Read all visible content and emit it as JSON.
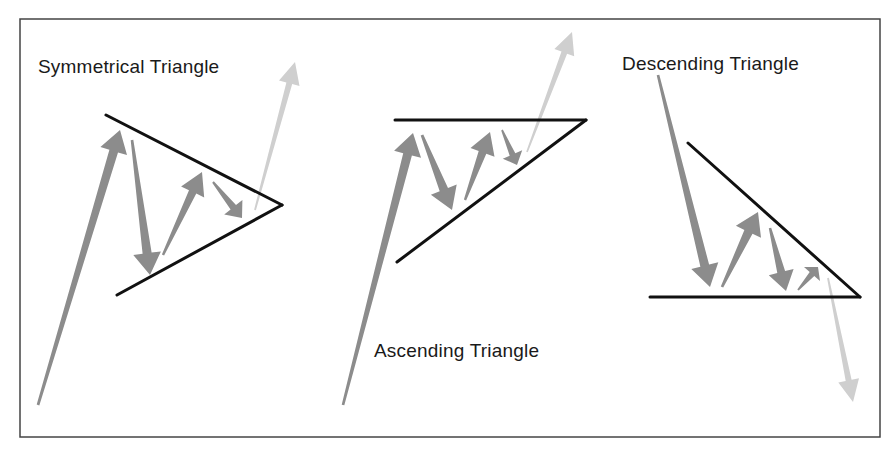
{
  "diagram": {
    "colors": {
      "frame": "#444444",
      "trendline": "#111111",
      "price_arrow": "#8c8c8c",
      "breakout_arrow": "#cfcfcf",
      "text": "#1a1a1a"
    },
    "panels": [
      {
        "name": "symmetrical",
        "label": "Symmetrical Triangle",
        "trendlines": [
          {
            "from": [
              106,
              115
            ],
            "to": [
              282,
              205
            ]
          },
          {
            "from": [
              117,
              295
            ],
            "to": [
              282,
              205
            ]
          }
        ],
        "price_arrows": [
          {
            "from": [
              38,
              405
            ],
            "to": [
              120,
              130
            ],
            "width": 9
          },
          {
            "from": [
              132,
              140
            ],
            "to": [
              150,
              275
            ],
            "width": 9
          },
          {
            "from": [
              163,
              255
            ],
            "to": [
              202,
              172
            ],
            "width": 8
          },
          {
            "from": [
              213,
              182
            ],
            "to": [
              242,
              218
            ],
            "width": 7
          }
        ],
        "breakout_arrow": {
          "from": [
            255,
            210
          ],
          "to": [
            295,
            62
          ],
          "direction": "up"
        }
      },
      {
        "name": "ascending",
        "label": "Ascending Triangle",
        "trendlines": [
          {
            "from": [
              395,
              120
            ],
            "to": [
              586,
              120
            ]
          },
          {
            "from": [
              397,
              262
            ],
            "to": [
              586,
              120
            ]
          }
        ],
        "price_arrows": [
          {
            "from": [
              343,
              405
            ],
            "to": [
              413,
              133
            ],
            "width": 9
          },
          {
            "from": [
              422,
              135
            ],
            "to": [
              452,
              210
            ],
            "width": 9
          },
          {
            "from": [
              465,
              200
            ],
            "to": [
              490,
              132
            ],
            "width": 8
          },
          {
            "from": [
              502,
              130
            ],
            "to": [
              517,
              165
            ],
            "width": 6
          }
        ],
        "breakout_arrow": {
          "from": [
            527,
            152
          ],
          "to": [
            572,
            32
          ],
          "direction": "up"
        }
      },
      {
        "name": "descending",
        "label": "Descending Triangle",
        "trendlines": [
          {
            "from": [
              688,
              143
            ],
            "to": [
              860,
              297
            ]
          },
          {
            "from": [
              650,
              297
            ],
            "to": [
              860,
              297
            ]
          }
        ],
        "price_arrows": [
          {
            "from": [
              658,
              75
            ],
            "to": [
              710,
              287
            ],
            "width": 9
          },
          {
            "from": [
              722,
              287
            ],
            "to": [
              758,
              212
            ],
            "width": 9
          },
          {
            "from": [
              770,
              228
            ],
            "to": [
              786,
              291
            ],
            "width": 8
          },
          {
            "from": [
              798,
              290
            ],
            "to": [
              818,
              267
            ],
            "width": 6
          }
        ],
        "breakout_arrow": {
          "from": [
            828,
            278
          ],
          "to": [
            853,
            402
          ],
          "direction": "down"
        }
      }
    ]
  }
}
